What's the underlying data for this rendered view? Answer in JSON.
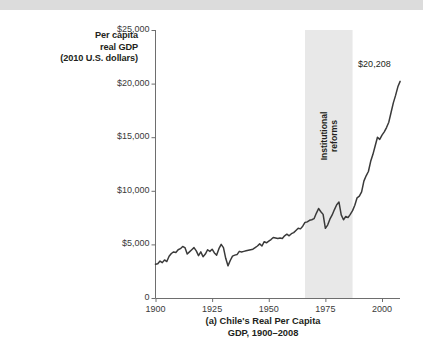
{
  "figure": {
    "caption_line1": "(a) Chile's Real Per Capita",
    "caption_line2": "GDP, 1900–2008",
    "axis_title_line1": "Per capita",
    "axis_title_line2": "real GDP",
    "axis_title_line3": "(2010 U.S. dollars)",
    "endpoint_label": "$20,208",
    "band_label_line1": "Institutional",
    "band_label_line2": "reforms"
  },
  "colors": {
    "line": "#3a3a3a",
    "axis": "#6e6e6e",
    "band": "#e8e8e8",
    "top_band": "#dcdcdc",
    "text": "#231f20"
  },
  "chart_data": {
    "type": "line",
    "title": "(a) Chile's Real Per Capita GDP, 1900–2008",
    "xlabel": "",
    "ylabel": "Per capita real GDP (2010 U.S. dollars)",
    "xlim": [
      1900,
      2008
    ],
    "ylim": [
      0,
      25000
    ],
    "grid": false,
    "legend": "none",
    "ytick_labels": [
      "0",
      "$5,000",
      "$10,000",
      "$15,000",
      "$20,000",
      "$25,000"
    ],
    "ytick_values": [
      0,
      5000,
      10000,
      15000,
      20000,
      25000
    ],
    "xtick_labels": [
      "1900",
      "1925",
      "1950",
      "1975",
      "2000"
    ],
    "xtick_values": [
      1900,
      1925,
      1950,
      1975,
      2000
    ],
    "annotations": [
      {
        "text": "Institutional reforms",
        "type": "shaded-band",
        "x_start": 1966,
        "x_end": 1987
      },
      {
        "text": "$20,208",
        "type": "endpoint-label",
        "x": 2008,
        "y": 20208
      }
    ],
    "series": [
      {
        "name": "Chile real GDP per capita",
        "x": [
          1900,
          1901,
          1902,
          1903,
          1904,
          1905,
          1906,
          1907,
          1908,
          1909,
          1910,
          1911,
          1912,
          1913,
          1914,
          1915,
          1916,
          1917,
          1918,
          1919,
          1920,
          1921,
          1922,
          1923,
          1924,
          1925,
          1926,
          1927,
          1928,
          1929,
          1930,
          1931,
          1932,
          1933,
          1934,
          1935,
          1936,
          1937,
          1938,
          1939,
          1940,
          1941,
          1942,
          1943,
          1944,
          1945,
          1946,
          1947,
          1948,
          1949,
          1950,
          1951,
          1952,
          1953,
          1954,
          1955,
          1956,
          1957,
          1958,
          1959,
          1960,
          1961,
          1962,
          1963,
          1964,
          1965,
          1966,
          1967,
          1968,
          1969,
          1970,
          1971,
          1972,
          1973,
          1974,
          1975,
          1976,
          1977,
          1978,
          1979,
          1980,
          1981,
          1982,
          1983,
          1984,
          1985,
          1986,
          1987,
          1988,
          1989,
          1990,
          1991,
          1992,
          1993,
          1994,
          1995,
          1996,
          1997,
          1998,
          1999,
          2000,
          2001,
          2002,
          2003,
          2004,
          2005,
          2006,
          2007,
          2008
        ],
        "values": [
          3150,
          3200,
          3450,
          3300,
          3550,
          3400,
          3900,
          4150,
          4300,
          4250,
          4500,
          4600,
          4800,
          4700,
          4100,
          4300,
          4500,
          4700,
          4400,
          3950,
          4300,
          3850,
          4100,
          4500,
          4350,
          4550,
          4200,
          4000,
          4600,
          5000,
          4700,
          3700,
          3000,
          3500,
          3900,
          4000,
          4050,
          4350,
          4300,
          4350,
          4400,
          4450,
          4500,
          4550,
          4700,
          4850,
          5050,
          4850,
          5250,
          5150,
          5300,
          5450,
          5650,
          5600,
          5550,
          5600,
          5550,
          5800,
          5950,
          5800,
          6000,
          6100,
          6300,
          6500,
          6450,
          6700,
          7050,
          7100,
          7250,
          7300,
          7400,
          7900,
          8350,
          8050,
          7800,
          6500,
          6800,
          7350,
          7750,
          8250,
          8700,
          8950,
          7750,
          7300,
          7600,
          7500,
          7800,
          8150,
          8650,
          9350,
          9500,
          9900,
          10900,
          11400,
          11800,
          12750,
          13400,
          14200,
          15000,
          14800,
          15200,
          15500,
          15900,
          16400,
          17300,
          18200,
          18900,
          19700,
          20208
        ]
      }
    ]
  }
}
